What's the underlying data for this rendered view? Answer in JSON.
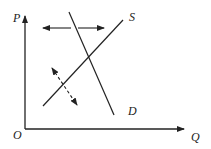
{
  "diagram": {
    "axes": {
      "y_label": "P",
      "x_label": "Q",
      "origin_label": "O"
    },
    "curves": [
      {
        "name": "S",
        "label": "S",
        "kind": "supply",
        "slope": "upward"
      },
      {
        "name": "D",
        "label": "D",
        "kind": "demand",
        "slope": "downward"
      }
    ],
    "arrows": [
      {
        "name": "demand-shift-arrow",
        "style": "solid",
        "direction": "horizontal-bidirectional"
      },
      {
        "name": "supply-shift-arrow",
        "style": "dashed",
        "direction": "diagonal-bidirectional"
      }
    ],
    "colors": {
      "line": "#222222",
      "background": "#ffffff"
    }
  }
}
